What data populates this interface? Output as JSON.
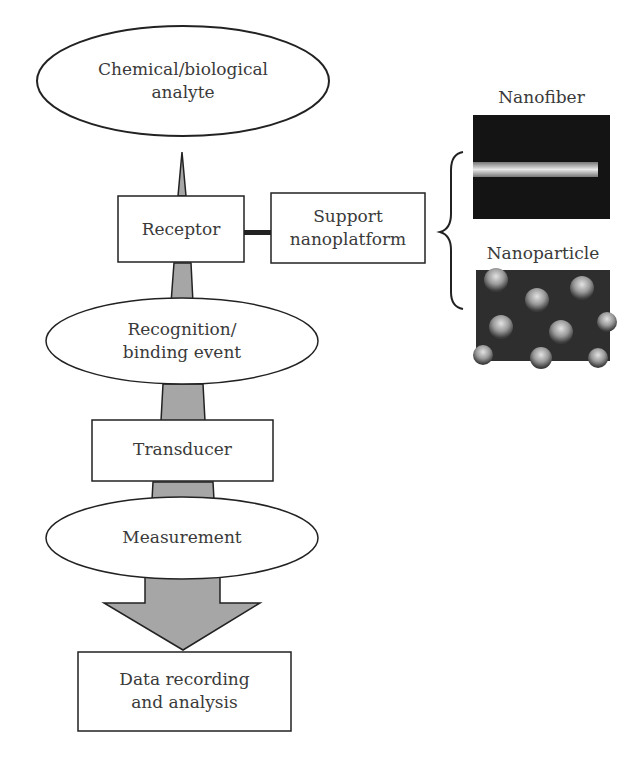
{
  "diagram": {
    "type": "flowchart",
    "colors": {
      "arrow_fill": "#a6a6a6",
      "stroke": "#222222",
      "background": "#ffffff"
    },
    "nodes": {
      "analyte": {
        "shape": "ellipse",
        "line1": "Chemical/biological",
        "line2": "analyte"
      },
      "receptor": {
        "shape": "rectangle",
        "label": "Receptor"
      },
      "support": {
        "shape": "rectangle",
        "line1": "Support",
        "line2": "nanoplatform"
      },
      "recognition": {
        "shape": "ellipse",
        "line1": "Recognition/",
        "line2": "binding event"
      },
      "transducer": {
        "shape": "rectangle",
        "label": "Transducer"
      },
      "measurement": {
        "shape": "ellipse",
        "label": "Measurement"
      },
      "data": {
        "shape": "rectangle",
        "line1": "Data recording",
        "line2": "and analysis"
      }
    },
    "examples": {
      "nanofiber": {
        "label": "Nanofiber",
        "image": "SEM image of a single nanofiber"
      },
      "nanoparticle": {
        "label": "Nanoparticle",
        "image": "SEM image of nanoparticle array"
      }
    },
    "edges": [
      {
        "from": "analyte",
        "to": "data",
        "style": "widening gray arrow"
      },
      {
        "from": "receptor",
        "to": "support",
        "style": "thick connector"
      },
      {
        "from": "support",
        "to": "examples",
        "style": "curly brace"
      }
    ]
  }
}
